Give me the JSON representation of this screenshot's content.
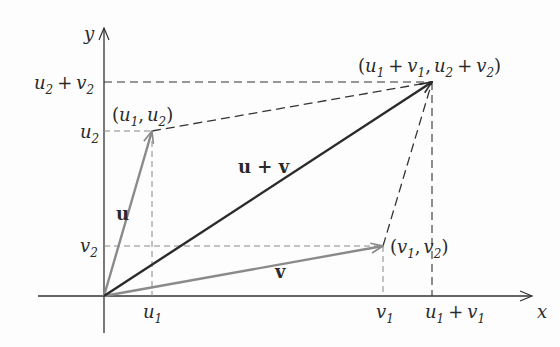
{
  "diagram": {
    "axes": {
      "x_label": "x",
      "y_label": "y"
    },
    "ticks": {
      "x": [
        {
          "main": "u",
          "sub": "1",
          "x": 152
        },
        {
          "main": "v",
          "sub": "1",
          "x": 383
        },
        {
          "main": "u",
          "sub": "1",
          "plus": "v",
          "sub2": "1",
          "x": 432
        }
      ],
      "y": [
        {
          "main": "u",
          "sub": "2",
          "plus": "v",
          "sub2": "2",
          "y": 82
        },
        {
          "main": "u",
          "sub": "2",
          "y": 131
        },
        {
          "main": "v",
          "sub": "2",
          "y": 246
        }
      ]
    },
    "vectors": [
      {
        "name": "u",
        "label": "u",
        "from": [
          104,
          296
        ],
        "to": [
          152,
          131
        ],
        "color": "#8a8a8a"
      },
      {
        "name": "v",
        "label": "v",
        "from": [
          104,
          296
        ],
        "to": [
          383,
          246
        ],
        "color": "#8a8a8a"
      },
      {
        "name": "u+v",
        "label": "u + v",
        "from": [
          104,
          296
        ],
        "to": [
          432,
          82
        ],
        "color": "#2b2b2b"
      }
    ],
    "points": {
      "u_tip": "(u1, u2)",
      "v_tip": "(v1, v2)",
      "sum_tip": "(u1 + v1, u2 + v2)"
    },
    "text": {
      "u_label": "u",
      "v_label": "v",
      "sum_label": "u + v",
      "plus": "+",
      "comma": ",",
      "open": "(",
      "close": ")"
    },
    "colors": {
      "axis": "#333333",
      "vector_gray": "#8a8a8a",
      "vector_dark": "#2b2b2b",
      "dash_dark": "#333333",
      "dash_gray": "#888888"
    }
  }
}
